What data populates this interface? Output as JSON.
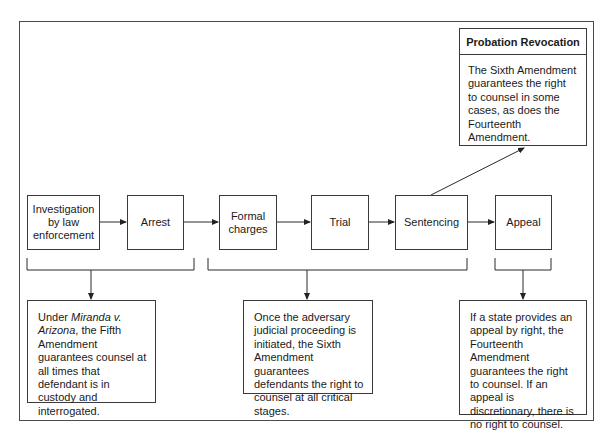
{
  "diagram": {
    "type": "flowchart",
    "stages": [
      {
        "id": "investigation",
        "label": "Investigation by law enforcement",
        "lines": [
          "Investigation",
          "by law",
          "enforcement"
        ]
      },
      {
        "id": "arrest",
        "label": "Arrest"
      },
      {
        "id": "formal-charges",
        "label": "Formal charges",
        "lines": [
          "Formal",
          "charges"
        ]
      },
      {
        "id": "trial",
        "label": "Trial"
      },
      {
        "id": "sentencing",
        "label": "Sentencing"
      },
      {
        "id": "appeal",
        "label": "Appeal"
      }
    ],
    "notes": {
      "miranda": {
        "prefix": "Under ",
        "italic": "Miranda v. Arizona",
        "suffix": ", the Fifth Amendment guarantees counsel at all times that defendant is in custody and interrogated.",
        "covers": [
          "Investigation by law enforcement",
          "Arrest"
        ]
      },
      "sixth": {
        "text": "Once the adversary judicial proceeding is initiated, the Sixth Amendment guarantees defendants the right to counsel at all critical stages.",
        "covers": [
          "Formal charges",
          "Trial",
          "Sentencing"
        ]
      },
      "appeal": {
        "text": "If a state provides an appeal by right, the Fourteenth Amendment guarantees the right to counsel. If an appeal is discretionary, there is no right to counsel.",
        "covers": [
          "Appeal"
        ]
      }
    },
    "probation": {
      "title": "Probation Revocation",
      "text": "The Sixth Amendment guarantees the right to counsel in some cases, as does the Fourteenth Amendment.",
      "from": "Sentencing"
    }
  }
}
